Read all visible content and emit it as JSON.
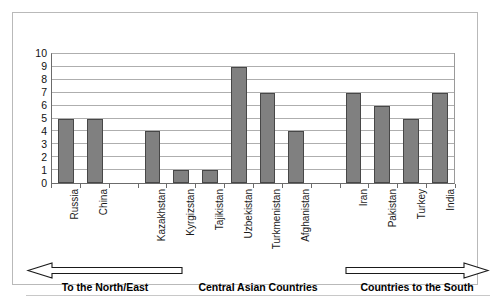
{
  "chart_data": {
    "type": "bar",
    "title": "",
    "subtitle": "",
    "xlabel": "",
    "ylabel": "",
    "ylim": [
      0,
      10
    ],
    "grid": true,
    "legend_position": "bottom",
    "y_ticks": [
      "10",
      "9",
      "8",
      "7",
      "6",
      "5",
      "4",
      "3",
      "2",
      "1",
      "0"
    ],
    "categories": [
      "Russia",
      "China",
      "",
      "Kazakhstan",
      "Kyrgizstan",
      "Tajikistan",
      "Uzbekistan",
      "Turkmenistan",
      "Afghanistan",
      "",
      "Iran",
      "Pakistan",
      "Turkey",
      "India"
    ],
    "values": [
      5,
      5,
      null,
      4,
      1,
      1,
      9,
      7,
      4,
      null,
      7,
      6,
      5,
      7
    ],
    "bar_color": "#808080",
    "bar_border_color": "#474747",
    "groups": [
      {
        "caption": "To the North/East",
        "arrow": "left-arrow-icon",
        "members": [
          "Russia",
          "China"
        ]
      },
      {
        "caption": "Central Asian Countries",
        "arrow": "none",
        "members": [
          "Kazakhstan",
          "Kyrgizstan",
          "Tajikistan",
          "Uzbekistan",
          "Turkmenistan",
          "Afghanistan"
        ]
      },
      {
        "caption": "Countries to the South",
        "arrow": "right-arrow-icon",
        "members": [
          "Iran",
          "Pakistan",
          "Turkey",
          "India"
        ]
      }
    ]
  }
}
